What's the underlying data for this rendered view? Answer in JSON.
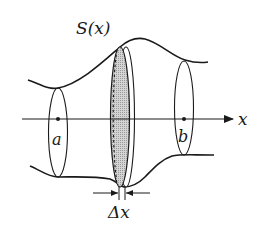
{
  "diagram": {
    "type": "solid-of-revolution-slice",
    "labels": {
      "section": "S(x)",
      "axis": "x",
      "lower_bound": "a",
      "upper_bound": "b",
      "thickness": "Δx"
    },
    "colors": {
      "stroke": "#1a1a1a",
      "slice_fill": "#c8c8c8",
      "background": "#ffffff"
    }
  }
}
